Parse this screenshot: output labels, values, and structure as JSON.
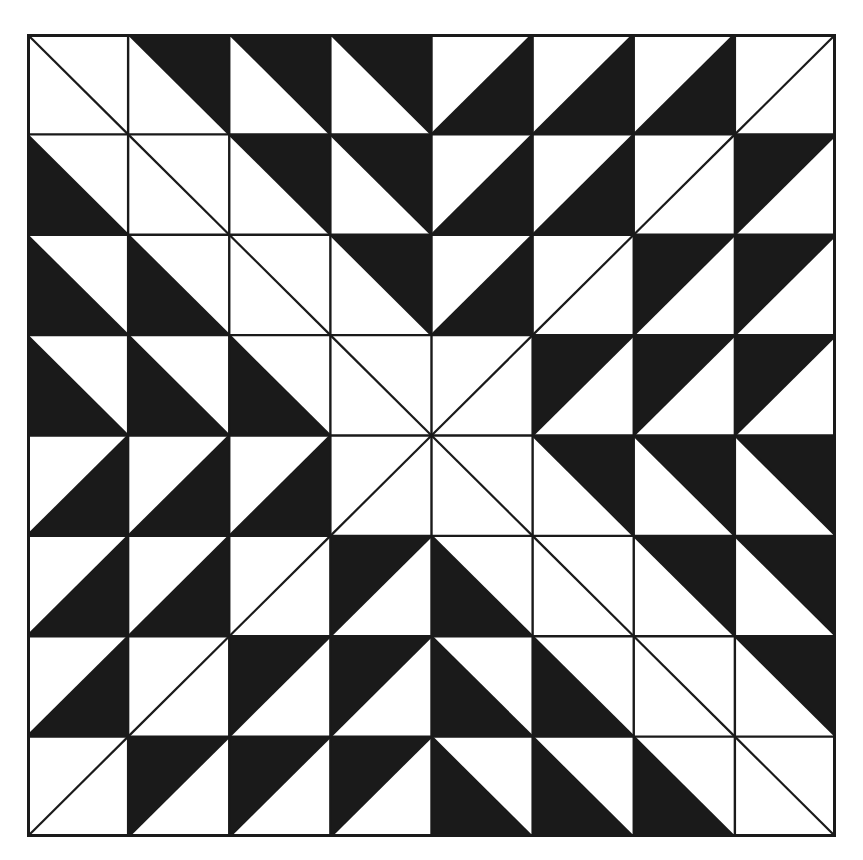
{
  "title": "Half-square triangle quilt block (8x8)",
  "colors": {
    "dark": "#1a1a1a",
    "light": "#ffffff",
    "line": "#1a1a1a"
  },
  "grid": {
    "rows": 8,
    "cols": 8
  },
  "legend": {
    "W\\\\": "white cell, top-left to bottom-right diagonal",
    "W/": "white cell, bottom-left to top-right diagonal",
    "UR": "black upper-right triangle (\\ diagonal)",
    "LL": "black lower-left triangle (\\ diagonal)",
    "UL": "black upper-left triangle (/ diagonal)",
    "LR": "black lower-right triangle (/ diagonal)"
  },
  "cells": [
    [
      "W\\",
      "UR",
      "UR",
      "UR",
      "LR",
      "LR",
      "LR",
      "W/"
    ],
    [
      "LL",
      "W\\",
      "UR",
      "UR",
      "LR",
      "LR",
      "W/",
      "UL"
    ],
    [
      "LL",
      "LL",
      "W\\",
      "UR",
      "LR",
      "W/",
      "UL",
      "UL"
    ],
    [
      "LL",
      "LL",
      "LL",
      "W\\",
      "W/",
      "UL",
      "UL",
      "UL"
    ],
    [
      "LR",
      "LR",
      "LR",
      "W/",
      "W\\",
      "UR",
      "UR",
      "UR"
    ],
    [
      "LR",
      "LR",
      "W/",
      "UL",
      "LL",
      "W\\",
      "UR",
      "UR"
    ],
    [
      "LR",
      "W/",
      "UL",
      "UL",
      "LL",
      "LL",
      "W\\",
      "UR"
    ],
    [
      "W/",
      "UL",
      "UL",
      "UL",
      "LL",
      "LL",
      "LL",
      "W\\"
    ]
  ]
}
